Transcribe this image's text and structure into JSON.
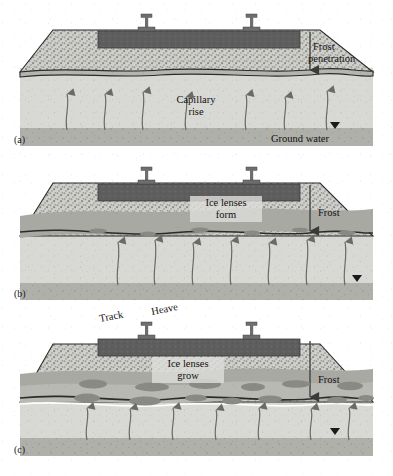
{
  "figure": {
    "type": "technical-cross-section-diagram",
    "background_color": "#ffffff",
    "panel_count": 3
  },
  "palette": {
    "rail_steel": "#6e6e6e",
    "sleeper_slab": "#5e5e5e",
    "ballast_fill": "#cfcfcb",
    "ballast_speckle": "#8d8d88",
    "subballast_band": "#a9a9a4",
    "frozen_band": "#b5b5b0",
    "subgrade_fill": "#d6d6d2",
    "groundwater_band": "#b0b0aa",
    "ice_lens": "#8a8a85",
    "outline": "#2b2b2b",
    "arrow": "#5a5a5a",
    "label_box": "#dcdcd8",
    "text": "#111111"
  },
  "panels": [
    {
      "id": "a",
      "label": "(a)",
      "stage": "initial frost penetration",
      "labels": [
        {
          "name": "frost-penetration-label",
          "lines": [
            "Frost",
            "penetration"
          ],
          "has_box": false
        },
        {
          "name": "capillary-rise-label",
          "lines": [
            "Capillary",
            "rise"
          ],
          "has_box": false
        },
        {
          "name": "ground-water-label",
          "lines": [
            "Ground water"
          ],
          "has_box": false
        }
      ],
      "frost_arrow": {
        "name": "frost-penetration-arrow",
        "direction": "down",
        "depth": "shallow"
      },
      "water_table_marker": true,
      "capillary_arrow_count": 7,
      "ice_lens_count": 0
    },
    {
      "id": "b",
      "label": "(b)",
      "stage": "ice lenses form",
      "labels": [
        {
          "name": "ice-lenses-form-label",
          "lines": [
            "Ice lenses",
            "form"
          ],
          "has_box": true
        },
        {
          "name": "frost-label",
          "lines": [
            "Frost"
          ],
          "has_box": false
        }
      ],
      "frost_arrow": {
        "name": "frost-arrow",
        "direction": "down",
        "depth": "medium"
      },
      "water_table_marker": true,
      "capillary_arrow_count": 7,
      "ice_lens_count": 6
    },
    {
      "id": "c",
      "label": "(c)",
      "stage": "ice lenses grow and track heaves",
      "labels": [
        {
          "name": "track-label",
          "lines": [
            "Track"
          ],
          "has_box": false,
          "rotated": true
        },
        {
          "name": "heave-label",
          "lines": [
            "Heave"
          ],
          "has_box": false,
          "rotated": true
        },
        {
          "name": "ice-lenses-grow-label",
          "lines": [
            "Ice lenses",
            "grow"
          ],
          "has_box": true
        },
        {
          "name": "frost-label",
          "lines": [
            "Frost"
          ],
          "has_box": false
        }
      ],
      "frost_arrow": {
        "name": "frost-arrow",
        "direction": "down",
        "depth": "deep"
      },
      "water_table_marker": true,
      "capillary_arrow_count": 7,
      "ice_lens_count": 14
    }
  ]
}
